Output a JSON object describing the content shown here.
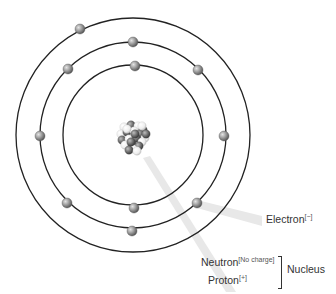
{
  "diagram": {
    "center": {
      "x": 133,
      "y": 135
    },
    "orbits": [
      {
        "name": "inner",
        "radius": 70
      },
      {
        "name": "middle",
        "radius": 93
      },
      {
        "name": "outer",
        "radius": 117
      }
    ],
    "electrons": [
      {
        "x": 80,
        "y": 29
      },
      {
        "x": 133,
        "y": 42
      },
      {
        "x": 68,
        "y": 69
      },
      {
        "x": 198,
        "y": 70
      },
      {
        "x": 135,
        "y": 66
      },
      {
        "x": 40,
        "y": 136
      },
      {
        "x": 224,
        "y": 136
      },
      {
        "x": 67,
        "y": 203
      },
      {
        "x": 134,
        "y": 208
      },
      {
        "x": 197,
        "y": 203
      },
      {
        "x": 132,
        "y": 231
      }
    ],
    "colors": {
      "orbit": "#222222",
      "electron_light": "#d8d8d8",
      "electron_dark": "#6a6a6a",
      "proton_dark": "#555555",
      "neutron_light": "#f2f2f2",
      "pointer": "#e6e6e6"
    }
  },
  "labels": {
    "electron": {
      "text": "Electron",
      "charge": "[−]"
    },
    "neutron": {
      "text": "Neutron",
      "charge": "[No charge]"
    },
    "proton": {
      "text": "Proton",
      "charge": "[+]"
    },
    "nucleus": "Nucleus"
  }
}
